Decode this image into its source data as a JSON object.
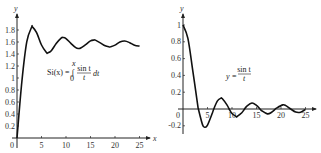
{
  "chart_data": [
    {
      "type": "line",
      "title": "Si(x) = ∫₀ˣ (sin t / t) dt",
      "equation_label": "Si(x) = ∫",
      "equation_lower": "0",
      "equation_upper": "x",
      "equation_num": "sin t",
      "equation_den": "t",
      "equation_tail": "dt",
      "xlabel": "x",
      "ylabel": "y",
      "x_ticks": [
        "5",
        "10",
        "15",
        "20",
        "25"
      ],
      "y_ticks": [
        "0.2",
        "0.4",
        "0.6",
        "0.8",
        "1",
        "1.2",
        "1.4",
        "1.6",
        "1.8"
      ],
      "origin_label": "0",
      "xlim": [
        0,
        26
      ],
      "ylim": [
        0,
        1.9
      ],
      "x": [
        0,
        1,
        2,
        3,
        3.14,
        4,
        5,
        6,
        6.28,
        7,
        8,
        9,
        9.42,
        10,
        11,
        12,
        12.57,
        13,
        14,
        15,
        15.71,
        16,
        17,
        18,
        18.85,
        19,
        20,
        21,
        21.99,
        23,
        24,
        25
      ],
      "values": [
        0,
        0.946,
        1.605,
        1.849,
        1.852,
        1.758,
        1.55,
        1.425,
        1.418,
        1.455,
        1.574,
        1.665,
        1.675,
        1.658,
        1.578,
        1.505,
        1.492,
        1.499,
        1.556,
        1.618,
        1.633,
        1.631,
        1.586,
        1.536,
        1.518,
        1.519,
        1.548,
        1.6,
        1.616,
        1.589,
        1.547,
        1.531
      ]
    },
    {
      "type": "line",
      "title": "y = sin t / t",
      "equation_label": "y =",
      "equation_num": "sin t",
      "equation_den": "t",
      "xlabel": "",
      "ylabel": "y",
      "x_ticks": [
        "5",
        "10",
        "15",
        "20",
        "25"
      ],
      "y_ticks": [
        "-0.2",
        "0.2",
        "0.4",
        "0.6",
        "0.8",
        "1"
      ],
      "origin_label": "0",
      "xlim": [
        0,
        26
      ],
      "ylim": [
        -0.25,
        1.05
      ],
      "x": [
        0,
        1,
        2,
        3,
        3.14,
        4,
        4.49,
        5,
        6,
        6.28,
        7,
        7.73,
        8,
        9,
        9.42,
        10,
        10.9,
        11,
        12,
        12.57,
        13,
        14.07,
        15,
        15.71,
        16,
        17.22,
        18,
        18.85,
        19,
        20.37,
        21,
        21.99,
        23,
        24,
        25
      ],
      "values": [
        1,
        0.841,
        0.455,
        0.047,
        0,
        -0.189,
        -0.217,
        -0.192,
        -0.047,
        0,
        0.094,
        0.128,
        0.124,
        0.046,
        0,
        -0.054,
        -0.091,
        -0.091,
        -0.045,
        0,
        0.032,
        0.071,
        0.043,
        0,
        -0.018,
        -0.058,
        -0.042,
        0,
        0.008,
        0.049,
        0.04,
        0,
        -0.037,
        -0.038,
        -0.005
      ]
    }
  ]
}
